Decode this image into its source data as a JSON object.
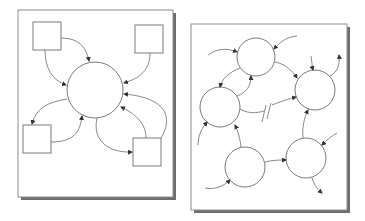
{
  "figure": {
    "panels": [
      {
        "id": "centralized",
        "frame": {
          "x": 18,
          "y": 10,
          "w": 155,
          "h": 187
        },
        "hub": {
          "cx": 95,
          "cy": 90,
          "r": 28
        },
        "nodes": [
          {
            "id": "top-left",
            "x": 33,
            "y": 22,
            "w": 28,
            "h": 28
          },
          {
            "id": "top-right",
            "x": 135,
            "y": 25,
            "w": 28,
            "h": 28
          },
          {
            "id": "bottom-left",
            "x": 23,
            "y": 125,
            "w": 28,
            "h": 28
          },
          {
            "id": "bottom-right",
            "x": 133,
            "y": 138,
            "w": 28,
            "h": 28
          }
        ]
      },
      {
        "id": "distributed",
        "frame": {
          "x": 191,
          "y": 24,
          "w": 156,
          "h": 186
        },
        "nodes": [
          {
            "id": "top",
            "cx": 256,
            "cy": 57,
            "r": 19
          },
          {
            "id": "left",
            "cx": 220,
            "cy": 107,
            "r": 20
          },
          {
            "id": "right",
            "cx": 315,
            "cy": 90,
            "r": 20
          },
          {
            "id": "bottom-left",
            "cx": 245,
            "cy": 167,
            "r": 20
          },
          {
            "id": "bottom-right",
            "cx": 306,
            "cy": 158,
            "r": 20
          }
        ],
        "broken_link_marker": "//"
      }
    ],
    "colors": {
      "line": "#7a7a7a",
      "frame": "#8c8c8c",
      "shadow": "#6e6e6e",
      "arrow": "#333333"
    }
  }
}
